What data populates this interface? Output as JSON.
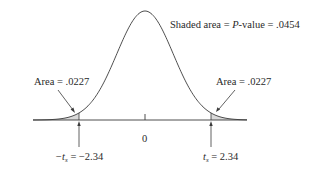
{
  "chart_data": {
    "type": "area",
    "title": "",
    "xlabel": "",
    "ylabel": "",
    "grid": false,
    "legend": null,
    "x_ticks": [
      {
        "value": 0,
        "label": "0"
      }
    ],
    "critical_values": {
      "left": {
        "label_prefix": "−t",
        "subscript": "s",
        "label_suffix": " = −2.34",
        "value": -2.34
      },
      "right": {
        "label_prefix": "t",
        "subscript": "s",
        "label_suffix": " = 2.34",
        "value": 2.34
      }
    },
    "shaded_regions": [
      {
        "side": "left",
        "from": "-inf",
        "to": -2.34,
        "area": 0.0227
      },
      {
        "side": "right",
        "from": 2.34,
        "to": "inf",
        "area": 0.0227
      }
    ],
    "annotations": {
      "total": "Shaded area = P-value = .0454",
      "left_area": "Area = .0227",
      "right_area": "Area = .0227"
    },
    "p_value": 0.0454,
    "colors": {
      "curve": "#3a3a3a",
      "shade": "#d9d9d9",
      "axis": "#3a3a3a",
      "text": "#2a2a2a"
    }
  },
  "labels": {
    "total_prefix": "Shaded area = ",
    "total_p": "P",
    "total_suffix": "-value = .0454",
    "left_area": "Area = .0227",
    "right_area": "Area = .0227",
    "zero": "0",
    "left_crit_prefix": "−t",
    "left_crit_sub": "s",
    "left_crit_suffix": " = −2.34",
    "right_crit_prefix": "t",
    "right_crit_sub": "s",
    "right_crit_suffix": " = 2.34"
  }
}
